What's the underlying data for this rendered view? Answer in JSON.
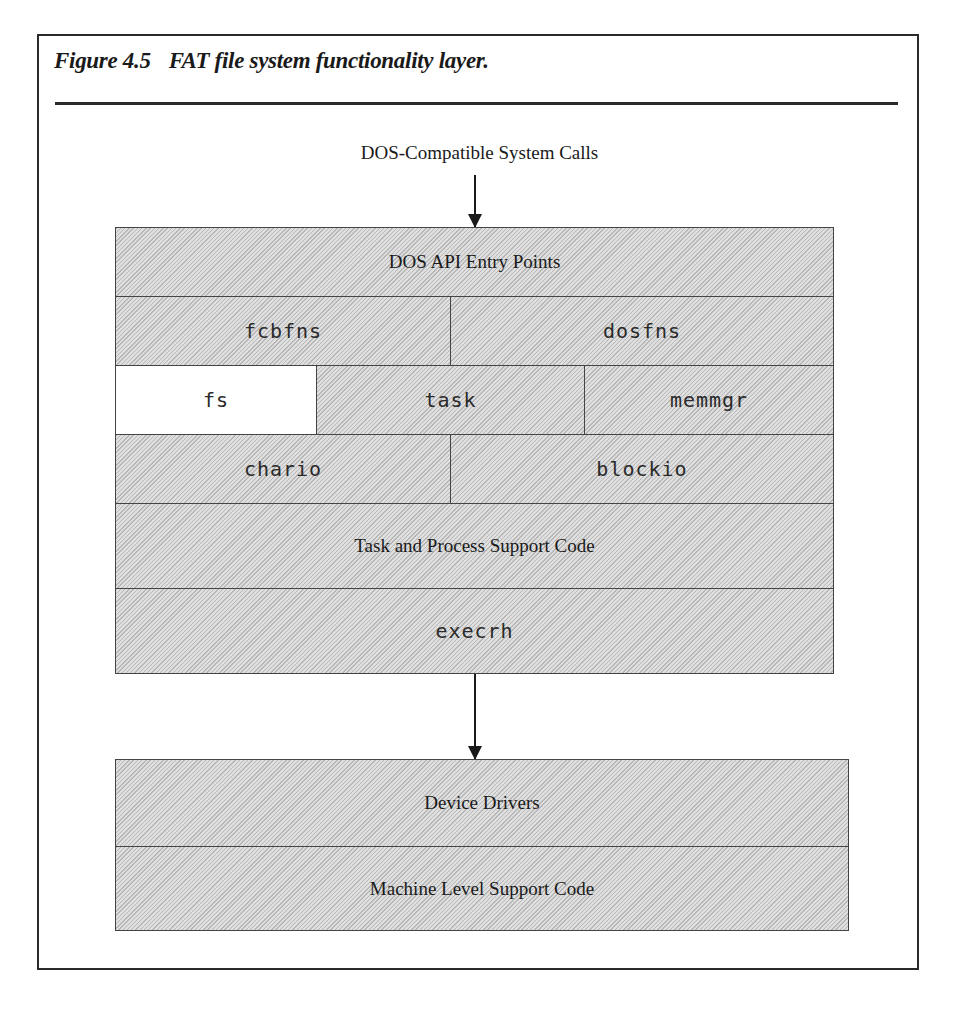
{
  "figure": {
    "number": "Figure 4.5",
    "title": "FAT file system functionality layer."
  },
  "diagram": {
    "top_label": "DOS-Compatible System Calls",
    "upper_stack": {
      "rows": [
        {
          "cells": [
            {
              "label": "DOS API Entry Points",
              "style": "serif"
            }
          ]
        },
        {
          "cells": [
            {
              "label": "fcbfns",
              "style": "mono"
            },
            {
              "label": "dosfns",
              "style": "mono"
            }
          ]
        },
        {
          "cells": [
            {
              "label": "fs",
              "style": "mono",
              "highlight": "white"
            },
            {
              "label": "task",
              "style": "mono"
            },
            {
              "label": "memmgr",
              "style": "mono"
            }
          ]
        },
        {
          "cells": [
            {
              "label": "chario",
              "style": "mono"
            },
            {
              "label": "blockio",
              "style": "mono"
            }
          ]
        },
        {
          "cells": [
            {
              "label": "Task and Process Support Code",
              "style": "serif"
            }
          ]
        },
        {
          "cells": [
            {
              "label": "execrh",
              "style": "mono"
            }
          ]
        }
      ]
    },
    "lower_stack": {
      "rows": [
        {
          "cells": [
            {
              "label": "Device Drivers",
              "style": "serif"
            }
          ]
        },
        {
          "cells": [
            {
              "label": "Machine Level Support Code",
              "style": "serif"
            }
          ]
        }
      ]
    },
    "colors": {
      "fill": "#d9d9d9",
      "highlight": "#ffffff",
      "line": "#444444"
    }
  }
}
